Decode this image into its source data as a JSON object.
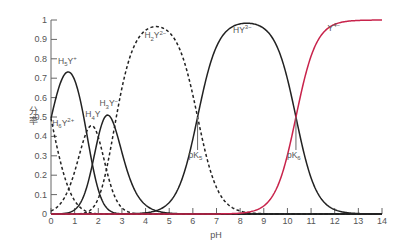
{
  "chart_data": {
    "type": "line",
    "title": "",
    "xlabel": "pH",
    "ylabel": "分率",
    "xlim": [
      0,
      14
    ],
    "ylim": [
      0,
      1
    ],
    "xticks": [
      0,
      1,
      2,
      3,
      4,
      5,
      6,
      7,
      8,
      9,
      10,
      11,
      12,
      13,
      14
    ],
    "yticks": [
      0,
      0.1,
      0.2,
      0.3,
      0.4,
      0.5,
      0.6,
      0.7,
      0.8,
      0.9,
      1
    ],
    "ytick_labels": [
      "0",
      "0.1",
      "0.2",
      "0.3",
      "0.4",
      "0.5",
      "0.6",
      "0.7",
      "0.8",
      "0.9",
      "1"
    ],
    "grid": false,
    "legend": "none (inline labels)",
    "pKa": [
      0.0,
      1.5,
      2.0,
      2.69,
      6.2,
      10.36
    ],
    "series": [
      {
        "name": "H6Y2+",
        "label_main": "H",
        "label_sub": "6",
        "label_tail": "Y",
        "label_sup": "2+",
        "style": "dashed",
        "color": "#222222",
        "label_pos": [
          0.05,
          0.455
        ],
        "peak_pH": 0.0,
        "peak_value": 0.5
      },
      {
        "name": "H5Y+",
        "label_main": "H",
        "label_sub": "5",
        "label_tail": "Y",
        "label_sup": "+",
        "style": "solid",
        "color": "#222222",
        "label_pos": [
          0.3,
          0.775
        ],
        "peak_pH": 0.75,
        "peak_value": 0.73
      },
      {
        "name": "H4Y",
        "label_main": "H",
        "label_sub": "4",
        "label_tail": "Y",
        "label_sup": "",
        "style": "dashed",
        "color": "#222222",
        "label_pos": [
          1.45,
          0.5
        ],
        "peak_pH": 1.75,
        "peak_value": 0.46
      },
      {
        "name": "H3Y-",
        "label_main": "H",
        "label_sub": "3",
        "label_tail": "Y",
        "label_sup": "−",
        "style": "solid",
        "color": "#222222",
        "label_pos": [
          2.05,
          0.555
        ],
        "peak_pH": 2.35,
        "peak_value": 0.51
      },
      {
        "name": "H2Y2-",
        "label_main": "H",
        "label_sub": "2",
        "label_tail": "Y",
        "label_sup": "2−",
        "style": "dashed",
        "color": "#222222",
        "label_pos": [
          3.95,
          0.905
        ],
        "peak_pH": 4.45,
        "peak_value": 0.97
      },
      {
        "name": "HY3-",
        "label_main": "HY",
        "label_sub": "",
        "label_tail": "",
        "label_sup": "3−",
        "style": "solid",
        "color": "#222222",
        "label_pos": [
          7.7,
          0.935
        ],
        "peak_pH": 8.3,
        "peak_value": 0.98
      },
      {
        "name": "Y4-",
        "label_main": "Y",
        "label_sub": "",
        "label_tail": "",
        "label_sup": "4−",
        "style": "solid",
        "color": "#c8234b",
        "label_pos": [
          11.7,
          0.945
        ],
        "peak_pH": 14.0,
        "peak_value": 1.0
      }
    ],
    "annotations": [
      {
        "text_main": "pK",
        "text_sub": "5",
        "x": 6.2,
        "line_from": 0.5,
        "line_to": 0.33,
        "text_y": 0.29
      },
      {
        "text_main": "pK",
        "text_sub": "6",
        "x": 10.36,
        "line_from": 0.5,
        "line_to": 0.33,
        "text_y": 0.29
      }
    ]
  }
}
